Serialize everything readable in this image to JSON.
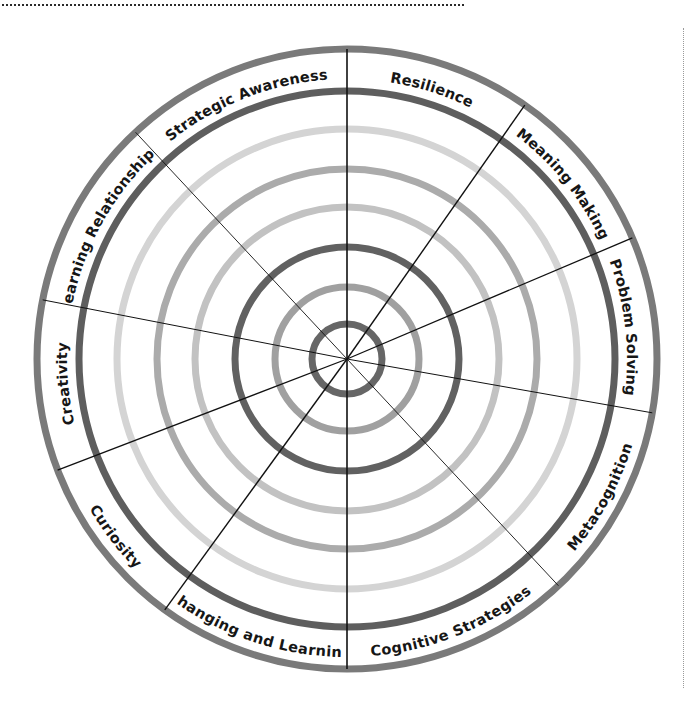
{
  "diagram": {
    "center": {
      "x": 347,
      "y": 359
    },
    "rings": [
      {
        "radius": 310,
        "stroke": "#7a7a7a",
        "width": 7,
        "role": "outer-border"
      },
      {
        "radius": 268,
        "stroke": "#5e5e5e",
        "width": 7,
        "role": "label-band-inner"
      },
      {
        "radius": 230,
        "stroke": "#d4d4d4",
        "width": 7,
        "role": "level-ring"
      },
      {
        "radius": 190,
        "stroke": "#ababab",
        "width": 7,
        "role": "level-ring"
      },
      {
        "radius": 152,
        "stroke": "#c2c2c2",
        "width": 7,
        "role": "level-ring"
      },
      {
        "radius": 112,
        "stroke": "#616161",
        "width": 7,
        "role": "level-ring"
      },
      {
        "radius": 72,
        "stroke": "#a0a0a0",
        "width": 7,
        "role": "level-ring"
      },
      {
        "radius": 35,
        "stroke": "#666666",
        "width": 7,
        "role": "level-ring"
      }
    ],
    "spokes": [
      {
        "angle": 0,
        "width": 1.6
      },
      {
        "angle": 35,
        "width": 1.4
      },
      {
        "angle": 67,
        "width": 1.3
      },
      {
        "angle": 100,
        "width": 1.0
      },
      {
        "angle": 137,
        "width": 0.9
      },
      {
        "angle": 180,
        "width": 1.6
      },
      {
        "angle": 216,
        "width": 1.4
      },
      {
        "angle": 249,
        "width": 1.3
      },
      {
        "angle": 281,
        "width": 1.0
      },
      {
        "angle": 317,
        "width": 0.9
      }
    ],
    "label_radius": 289,
    "segments": [
      {
        "label": "Resilience",
        "start": 0,
        "end": 35
      },
      {
        "label": "Meaning Making",
        "start": 35,
        "end": 67
      },
      {
        "label": "Problem Solving",
        "start": 67,
        "end": 100
      },
      {
        "label": "Metacognition",
        "start": 100,
        "end": 137
      },
      {
        "label": "Cognitive Strategies",
        "start": 137,
        "end": 180
      },
      {
        "label": "Changing and Learning",
        "start": 180,
        "end": 216
      },
      {
        "label": "Curiosity",
        "start": 216,
        "end": 249
      },
      {
        "label": "Creativity",
        "start": 249,
        "end": 281
      },
      {
        "label": "Learning Relationships",
        "start": 281,
        "end": 317
      },
      {
        "label": "Strategic Awareness",
        "start": 317,
        "end": 360
      }
    ],
    "spoke_color": "#111111"
  }
}
